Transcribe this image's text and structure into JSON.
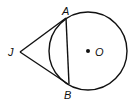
{
  "diagram": {
    "labels": {
      "A": "A",
      "B": "B",
      "J": "J",
      "O": "O"
    },
    "colors": {
      "stroke": "#111111",
      "background": "#ffffff"
    }
  }
}
